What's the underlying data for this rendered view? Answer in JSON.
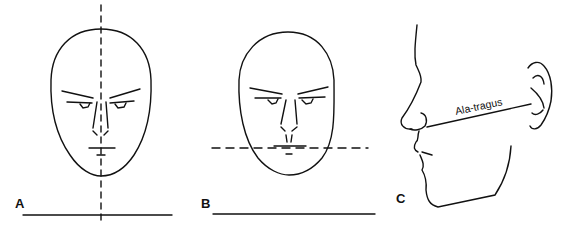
{
  "panels": [
    {
      "id": "A",
      "label": "A",
      "description": "Frontal face with vertical dashed midline"
    },
    {
      "id": "B",
      "label": "B",
      "description": "Frontal face with horizontal dashed occlusal-level line"
    },
    {
      "id": "C",
      "label": "C",
      "description": "Profile view with ala-tragus line",
      "annotation": "Ala-tragus"
    }
  ],
  "colors": {
    "stroke": "#111111",
    "background": "#ffffff"
  }
}
